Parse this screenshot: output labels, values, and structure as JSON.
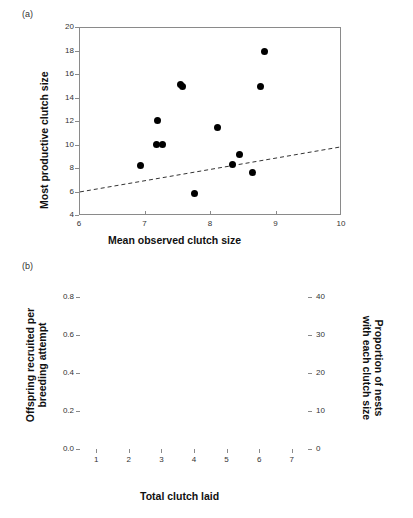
{
  "figure": {
    "panel_a_label": "(a)",
    "panel_b_label": "(b)"
  },
  "chart_data": [
    {
      "type": "scatter",
      "panel": "(a)",
      "title": "",
      "xlabel": "Mean observed clutch size",
      "ylabel": "Most productive clutch size",
      "xlim": [
        6,
        10
      ],
      "ylim": [
        4,
        20
      ],
      "xticks": [
        6,
        7,
        8,
        9,
        10
      ],
      "yticks": [
        4,
        6,
        8,
        10,
        12,
        14,
        16,
        18,
        20
      ],
      "grid": false,
      "legend": "none",
      "marker_color": "#000000",
      "points": [
        {
          "x": 6.93,
          "y": 8.3
        },
        {
          "x": 7.18,
          "y": 12.1
        },
        {
          "x": 7.17,
          "y": 10.1
        },
        {
          "x": 7.26,
          "y": 10.1
        },
        {
          "x": 7.54,
          "y": 15.2
        },
        {
          "x": 7.56,
          "y": 15.0
        },
        {
          "x": 7.75,
          "y": 5.95
        },
        {
          "x": 8.1,
          "y": 11.55
        },
        {
          "x": 8.33,
          "y": 8.4
        },
        {
          "x": 8.44,
          "y": 9.2
        },
        {
          "x": 8.63,
          "y": 7.7
        },
        {
          "x": 8.76,
          "y": 15.0
        },
        {
          "x": 8.81,
          "y": 18.0
        }
      ],
      "trend_line": {
        "style": "dashed",
        "color": "#333333",
        "x0": 6.0,
        "y0": 6.05,
        "x1": 10.0,
        "y1": 9.9
      }
    },
    {
      "type": "bar",
      "panel": "(b)",
      "title": "",
      "xlabel": "Total clutch laid",
      "ylabel": "Offspring recruited per breeding attempt",
      "ylabel_line1": "Offspring recruited per",
      "ylabel_line2": "breeding attempt",
      "y2label": "Proportion of nests with each clutch size",
      "y2label_line1": "Proportion of nests",
      "y2label_line2": "with each clutch size",
      "categories": [
        "1",
        "2",
        "3",
        "4",
        "5",
        "6",
        "7"
      ],
      "ylim": [
        0.0,
        0.8
      ],
      "yticks": [
        "0.0",
        "0.2",
        "0.4",
        "0.6",
        "0.8"
      ],
      "ytick_values": [
        0.0,
        0.2,
        0.4,
        0.6,
        0.8
      ],
      "y2lim": [
        0,
        40
      ],
      "y2ticks": [
        "0",
        "10",
        "20",
        "30",
        "40"
      ],
      "y2tick_values": [
        0,
        10,
        20,
        30,
        40
      ],
      "grid": false,
      "legend": "none",
      "bar_color": "#a9a9a9",
      "bar_edge_color": "#6e6e6e",
      "values": [
        0.04,
        0.14,
        0.38,
        0.735,
        0.555,
        0.215,
        0.07
      ],
      "series": [
        {
          "name": "Proportion of nests with each clutch size",
          "axis": "right",
          "style": "dashed-line-with-markers",
          "color": "#000000",
          "values": [
            3.5,
            8.0,
            12.5,
            17.5,
            23.5,
            26.5,
            25.5
          ],
          "errors_low": [
            2.3,
            5.3,
            10.0,
            15.8,
            21.0,
            23.0,
            21.0
          ],
          "errors_high": [
            4.8,
            10.8,
            15.3,
            19.3,
            26.0,
            30.2,
            30.0
          ]
        }
      ]
    }
  ]
}
